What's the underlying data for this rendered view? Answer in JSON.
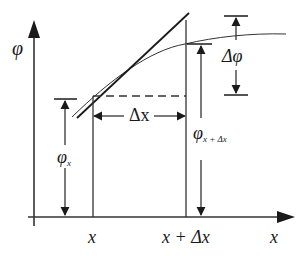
{
  "diagram": {
    "type": "finite-difference derivative illustration",
    "axes": {
      "y_label": "φ",
      "x_label": "x"
    },
    "x_ticks": [
      {
        "label": "x"
      },
      {
        "label": "x + Δx"
      }
    ],
    "annotations": {
      "delta_x": "Δx",
      "delta_phi": "Δφ",
      "phi_x": {
        "base": "φ",
        "sub": "x"
      },
      "phi_x_dx": {
        "base": "φ",
        "sub": "x + Δx"
      }
    },
    "elements": [
      "curve φ(x)",
      "tangent line at x",
      "dashed horizontal at φ_x",
      "vertical lines at x and x+Δx"
    ],
    "colors": {
      "ink": "#1a1a1a",
      "background": "#ffffff"
    }
  }
}
